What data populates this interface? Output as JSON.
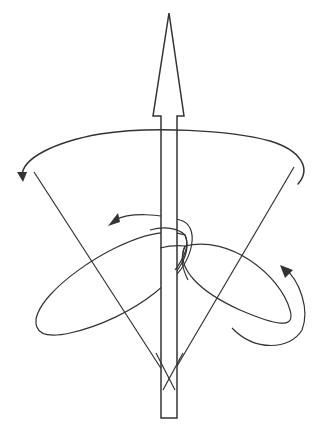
{
  "diagram": {
    "colors": {
      "stroke": "#333333",
      "background": "#ffffff"
    },
    "elements": [
      {
        "id": "vertical-axis-arrow",
        "shape": "arrow",
        "direction": "up"
      },
      {
        "id": "precession-arc-arrow",
        "shape": "curved-arrow",
        "direction": "counterclockwise-left"
      },
      {
        "id": "cone",
        "shape": "inverted-cone-lines"
      },
      {
        "id": "left-ellipse",
        "shape": "tilted-ellipse"
      },
      {
        "id": "right-ellipse",
        "shape": "tilted-ellipse"
      },
      {
        "id": "spin-curl-arrow",
        "shape": "curved-arrow",
        "direction": "left"
      },
      {
        "id": "lower-right-curl-arrow",
        "shape": "curved-arrow",
        "direction": "up"
      }
    ]
  }
}
